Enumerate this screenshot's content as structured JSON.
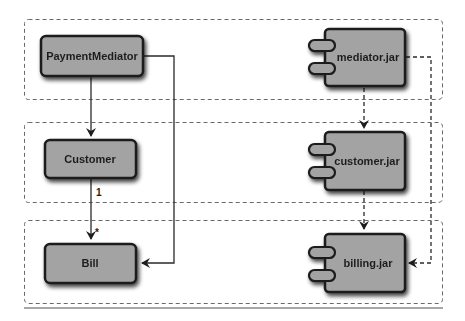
{
  "diagram": {
    "type": "uml-class-to-component-mapping",
    "colors": {
      "box_fill": "#a3a3a3",
      "box_stroke": "#1a1a1a",
      "line": "#2a2a2a",
      "group_dash": "#6a6a6a",
      "rule": "#8a8a8a"
    },
    "groups": [
      {
        "id": "layer-mediator",
        "label": ""
      },
      {
        "id": "layer-customer",
        "label": ""
      },
      {
        "id": "layer-billing",
        "label": ""
      }
    ],
    "classes": [
      {
        "id": "payment-mediator",
        "label": "PaymentMediator"
      },
      {
        "id": "customer",
        "label": "Customer"
      },
      {
        "id": "bill",
        "label": "Bill"
      }
    ],
    "components": [
      {
        "id": "mediator-jar",
        "label": "mediator.jar"
      },
      {
        "id": "customer-jar",
        "label": "customer.jar"
      },
      {
        "id": "billing-jar",
        "label": "billing.jar"
      }
    ],
    "associations": [
      {
        "from": "PaymentMediator",
        "to": "Customer",
        "style": "solid"
      },
      {
        "from": "Customer",
        "to": "Bill",
        "style": "solid",
        "source_multiplicity": "1",
        "target_multiplicity": "*"
      },
      {
        "from": "PaymentMediator",
        "to": "Bill",
        "style": "solid"
      }
    ],
    "dependencies": [
      {
        "from": "mediator.jar",
        "to": "customer.jar",
        "style": "dashed"
      },
      {
        "from": "customer.jar",
        "to": "billing.jar",
        "style": "dashed"
      },
      {
        "from": "mediator.jar",
        "to": "billing.jar",
        "style": "dashed"
      }
    ]
  }
}
